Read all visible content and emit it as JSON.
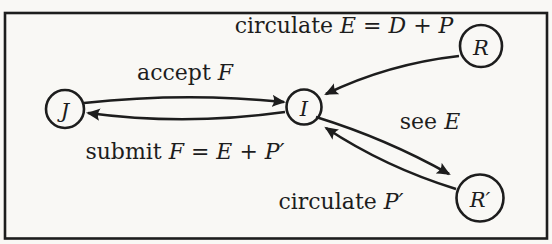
{
  "diagram": {
    "nodes": [
      {
        "id": "J",
        "label": "J"
      },
      {
        "id": "I",
        "label": "I"
      },
      {
        "id": "R",
        "label": "R"
      },
      {
        "id": "Rp",
        "label": "R′"
      }
    ],
    "edges": [
      {
        "from": "R",
        "to": "I",
        "label": "circulate E = D + P"
      },
      {
        "from": "J",
        "to": "I",
        "label": "accept F"
      },
      {
        "from": "I",
        "to": "J",
        "label": "submit F = E + P′"
      },
      {
        "from": "I",
        "to": "Rp",
        "label": "see E"
      },
      {
        "from": "Rp",
        "to": "I",
        "label": "circulate P′"
      }
    ],
    "edge_labels": [
      {
        "verb": "circulate",
        "math": "E = D + P"
      },
      {
        "verb": "accept",
        "math": "F"
      },
      {
        "verb": "submit",
        "math": "F = E + P′"
      },
      {
        "verb": "see",
        "math": "E"
      },
      {
        "verb": "circulate",
        "math": "P′"
      }
    ]
  },
  "colors": {
    "ink": "#1d1d1d",
    "paper": "#f9f8f5"
  }
}
